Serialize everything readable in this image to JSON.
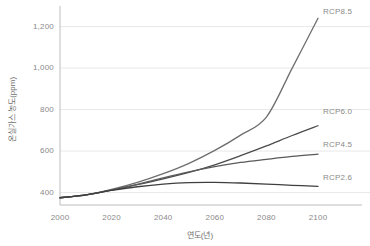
{
  "chart_data": {
    "type": "line",
    "title": "",
    "xlabel": "연도(년)",
    "ylabel": "온실가스 농도(ppm)",
    "xlim": [
      2000,
      2100
    ],
    "ylim": [
      340,
      1280
    ],
    "grid": true,
    "legend_position": "right-inline",
    "xticks": [
      "2000",
      "2020",
      "2040",
      "2060",
      "2080",
      "2100"
    ],
    "xtick_values": [
      2000,
      2020,
      2040,
      2060,
      2080,
      2100
    ],
    "yticks": [
      "400",
      "600",
      "800",
      "1,000",
      "1,200"
    ],
    "ytick_values": [
      400,
      600,
      800,
      1000,
      1200
    ],
    "x": [
      2000,
      2010,
      2020,
      2030,
      2040,
      2050,
      2060,
      2070,
      2080,
      2090,
      2100
    ],
    "series": [
      {
        "name": "RCP8.5",
        "color": "#6e6e6e",
        "values": [
          375,
          389,
          415,
          449,
          491,
          541,
          603,
          677,
          764,
          1000,
          1240
        ],
        "label_x": 2100,
        "label_y": 1270
      },
      {
        "name": "RCP6.0",
        "color": "#4a4a4a",
        "values": [
          375,
          388,
          412,
          438,
          466,
          497,
          534,
          578,
          625,
          675,
          722
        ],
        "label_x": 2100,
        "label_y": 790
      },
      {
        "name": "RCP4.5",
        "color": "#5a5a5a",
        "values": [
          375,
          389,
          412,
          440,
          471,
          500,
          525,
          545,
          560,
          574,
          585
        ],
        "label_x": 2100,
        "label_y": 628
      },
      {
        "name": "RCP2.6",
        "color": "#3f3f3f",
        "values": [
          375,
          389,
          410,
          428,
          441,
          448,
          449,
          446,
          441,
          435,
          430
        ],
        "label_x": 2100,
        "label_y": 472
      }
    ]
  },
  "axes": {
    "y_title": "온실가스 농도(ppm)",
    "x_title": "연도(년)",
    "grid_color": "#e8e8e8",
    "axis_color": "#bdbdbd",
    "tick_text_color": "#8a8a8a"
  }
}
